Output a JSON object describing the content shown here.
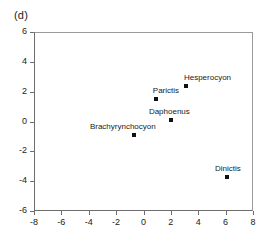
{
  "panel": {
    "label": "(d)"
  },
  "chart_data": {
    "type": "scatter",
    "title": "",
    "xlabel": "",
    "ylabel": "",
    "xlim": [
      -8,
      8
    ],
    "ylim": [
      -6,
      6
    ],
    "xticks": [
      -8,
      -6,
      -4,
      -2,
      0,
      2,
      4,
      6,
      8
    ],
    "yticks": [
      6,
      4,
      2,
      0,
      -2,
      -4,
      -6
    ],
    "xtick_labels": [
      "-8",
      "-6",
      "-4",
      "-2",
      "0",
      "2",
      "4",
      "6",
      "8"
    ],
    "ytick_labels": [
      "6",
      "4",
      "2",
      "0",
      "-2",
      "-4",
      "-6"
    ],
    "grid": false,
    "legend": false,
    "marker_color": "#111111",
    "points": [
      {
        "label": "Hesperocyon",
        "x": 3.1,
        "y": 2.4,
        "label_dx": -2,
        "label_dy": -13
      },
      {
        "label": "Parictis",
        "x": 0.9,
        "y": 1.5,
        "label_dx": -3,
        "label_dy": -13
      },
      {
        "label": "Daphoenus",
        "x": 2.0,
        "y": 0.1,
        "label_dx": -22,
        "label_dy": -13
      },
      {
        "label": "Brachyrynchocyon",
        "x": -0.7,
        "y": -0.9,
        "label_dx": -44,
        "label_dy": -13
      },
      {
        "label": "Dinictis",
        "x": 6.1,
        "y": -3.7,
        "label_dx": -12,
        "label_dy": -13
      }
    ]
  }
}
